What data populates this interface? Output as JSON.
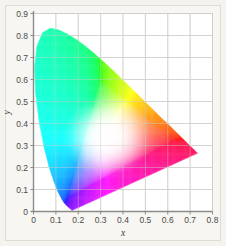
{
  "figure": {
    "name": "cie-1931-chromaticity-diagram",
    "background_color": "#f4f3ee",
    "plot_background_color": "#ffffff",
    "frame_border_color": "#dedcd4",
    "grid_color": "#d0cfca",
    "axis_color": "#8a8a86"
  },
  "chart_data": {
    "type": "scatter",
    "title": "",
    "subtitle": "",
    "xlabel": "x",
    "ylabel": "y",
    "xlim": [
      0,
      0.8
    ],
    "ylim": [
      0,
      0.9
    ],
    "xticks": [
      "0",
      "0.1",
      "0.2",
      "0.3",
      "0.4",
      "0.5",
      "0.6",
      "0.7",
      "0.8"
    ],
    "yticks": [
      "0",
      "0.1",
      "0.2",
      "0.3",
      "0.4",
      "0.5",
      "0.6",
      "0.7",
      "0.8",
      "0.9"
    ],
    "xtick_values": [
      0,
      0.1,
      0.2,
      0.3,
      0.4,
      0.5,
      0.6,
      0.7,
      0.8
    ],
    "ytick_values": [
      0,
      0.1,
      0.2,
      0.3,
      0.4,
      0.5,
      0.6,
      0.7,
      0.8,
      0.9
    ],
    "grid": true,
    "legend": "none",
    "annotations": [],
    "white_point": {
      "x": 0.333,
      "y": 0.34
    },
    "key_points": [
      {
        "name": "violet-end",
        "x": 0.175,
        "y": 0.005
      },
      {
        "name": "blue-primary",
        "x": 0.15,
        "y": 0.06
      },
      {
        "name": "cyan",
        "x": 0.009,
        "y": 0.51
      },
      {
        "name": "green-peak",
        "x": 0.08,
        "y": 0.834
      },
      {
        "name": "yellow",
        "x": 0.443,
        "y": 0.554
      },
      {
        "name": "orange",
        "x": 0.57,
        "y": 0.429
      },
      {
        "name": "red-end",
        "x": 0.735,
        "y": 0.265
      }
    ],
    "spectral_locus": [
      {
        "x": 0.1741,
        "y": 0.005
      },
      {
        "x": 0.174,
        "y": 0.005
      },
      {
        "x": 0.1738,
        "y": 0.0049
      },
      {
        "x": 0.1736,
        "y": 0.0049
      },
      {
        "x": 0.1733,
        "y": 0.0048
      },
      {
        "x": 0.173,
        "y": 0.0048
      },
      {
        "x": 0.1726,
        "y": 0.0048
      },
      {
        "x": 0.1721,
        "y": 0.0048
      },
      {
        "x": 0.1714,
        "y": 0.0051
      },
      {
        "x": 0.1703,
        "y": 0.0058
      },
      {
        "x": 0.1689,
        "y": 0.0069
      },
      {
        "x": 0.1669,
        "y": 0.0086
      },
      {
        "x": 0.1644,
        "y": 0.0109
      },
      {
        "x": 0.1611,
        "y": 0.0138
      },
      {
        "x": 0.1566,
        "y": 0.0177
      },
      {
        "x": 0.151,
        "y": 0.0227
      },
      {
        "x": 0.144,
        "y": 0.0297
      },
      {
        "x": 0.1355,
        "y": 0.0399
      },
      {
        "x": 0.1241,
        "y": 0.0578
      },
      {
        "x": 0.1096,
        "y": 0.0868
      },
      {
        "x": 0.0913,
        "y": 0.1327
      },
      {
        "x": 0.0687,
        "y": 0.2007
      },
      {
        "x": 0.0454,
        "y": 0.295
      },
      {
        "x": 0.0235,
        "y": 0.4127
      },
      {
        "x": 0.0082,
        "y": 0.5384
      },
      {
        "x": 0.0039,
        "y": 0.6548
      },
      {
        "x": 0.0139,
        "y": 0.7502
      },
      {
        "x": 0.0389,
        "y": 0.812
      },
      {
        "x": 0.0743,
        "y": 0.8338
      },
      {
        "x": 0.1142,
        "y": 0.8262
      },
      {
        "x": 0.1547,
        "y": 0.8059
      },
      {
        "x": 0.1929,
        "y": 0.7816
      },
      {
        "x": 0.2296,
        "y": 0.7543
      },
      {
        "x": 0.2658,
        "y": 0.7243
      },
      {
        "x": 0.3016,
        "y": 0.6923
      },
      {
        "x": 0.3373,
        "y": 0.6589
      },
      {
        "x": 0.3731,
        "y": 0.6245
      },
      {
        "x": 0.4087,
        "y": 0.5896
      },
      {
        "x": 0.4441,
        "y": 0.5547
      },
      {
        "x": 0.4788,
        "y": 0.5202
      },
      {
        "x": 0.5125,
        "y": 0.4866
      },
      {
        "x": 0.5448,
        "y": 0.4544
      },
      {
        "x": 0.5752,
        "y": 0.4242
      },
      {
        "x": 0.6029,
        "y": 0.3965
      },
      {
        "x": 0.627,
        "y": 0.3725
      },
      {
        "x": 0.6482,
        "y": 0.3514
      },
      {
        "x": 0.6658,
        "y": 0.334
      },
      {
        "x": 0.6801,
        "y": 0.3197
      },
      {
        "x": 0.6915,
        "y": 0.3083
      },
      {
        "x": 0.7006,
        "y": 0.2993
      },
      {
        "x": 0.7079,
        "y": 0.292
      },
      {
        "x": 0.714,
        "y": 0.2859
      },
      {
        "x": 0.719,
        "y": 0.2809
      },
      {
        "x": 0.723,
        "y": 0.277
      },
      {
        "x": 0.726,
        "y": 0.274
      },
      {
        "x": 0.7283,
        "y": 0.2717
      },
      {
        "x": 0.73,
        "y": 0.27
      },
      {
        "x": 0.7311,
        "y": 0.2689
      },
      {
        "x": 0.732,
        "y": 0.268
      },
      {
        "x": 0.7327,
        "y": 0.2673
      },
      {
        "x": 0.7334,
        "y": 0.2666
      },
      {
        "x": 0.734,
        "y": 0.266
      },
      {
        "x": 0.7344,
        "y": 0.2656
      },
      {
        "x": 0.7346,
        "y": 0.2654
      },
      {
        "x": 0.7347,
        "y": 0.2653
      }
    ]
  }
}
